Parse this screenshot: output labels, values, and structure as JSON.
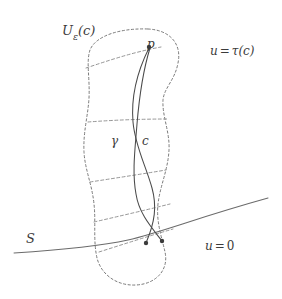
{
  "figure": {
    "kind": "mathematical-diagram",
    "width": 282,
    "height": 299,
    "background_color": "#ffffff",
    "stroke_color": "#4a4a4a",
    "dash_color": "#7a7a7a",
    "label_color": "#3b3b3b"
  },
  "labels": {
    "region": {
      "base": "U",
      "subscript": "ε",
      "arg": "(c)",
      "full": "Uε(c)"
    },
    "upper_level": {
      "lhs": "u",
      "op": "=",
      "rhs": "τ(c)",
      "full": "u = τ(c)"
    },
    "lower_level": {
      "lhs": "u",
      "op": "=",
      "rhs": "0",
      "full": "u = 0"
    },
    "point_p": "p",
    "curve_gamma": "γ",
    "curve_c": "c",
    "surface_s": "S"
  },
  "geometry": {
    "blob_outline": "M 148 29 C 170 30 182 44 178 63 C 175 80 164 88 163 100 C 162 116 170 132 169 150 C 168 170 160 186 158 204 C 156 222 162 238 165 252 C 169 270 156 284 136 285 C 116 286 101 274 97 258 C 93 240 96 222 94 204 C 92 184 85 170 84 152 C 83 132 88 116 89 98 C 90 78 86 62 90 50 C 96 35 122 28 148 29 Z",
    "level_lines": [
      {
        "name": "upper-level-line",
        "path": "M 86 68 C 110 60 134 52 161 47"
      },
      {
        "name": "mid-level-line-1",
        "path": "M 88 122 C 114 120 142 119 168 119"
      },
      {
        "name": "mid-level-line-2",
        "path": "M 90 182 C 116 178 142 174 166 170"
      },
      {
        "name": "mid-level-line-3",
        "path": "M 94 222 C 120 216 146 210 170 204"
      },
      {
        "name": "lower-level-line",
        "path": "M 99 252 C 124 244 149 236 173 229"
      }
    ],
    "curve_gamma_path": "M 149 48 C 136 74 131 98 133 122 C 135 146 146 166 152 188 C 157 206 155 222 146 243",
    "curve_c_path": "M 150 48 C 142 74 139 100 137 124 C 135 150 132 172 136 194 C 139 214 152 228 162 241",
    "surface_s_path": "M 14 253 C 60 250 96 247 128 240 C 162 232 196 218 268 198",
    "points": [
      {
        "name": "point-p",
        "x": 149,
        "y": 47,
        "r": 2.2
      },
      {
        "name": "point-gamma-foot",
        "x": 146,
        "y": 243,
        "r": 2.2
      },
      {
        "name": "point-c-foot",
        "x": 162,
        "y": 241,
        "r": 2.2
      }
    ]
  }
}
